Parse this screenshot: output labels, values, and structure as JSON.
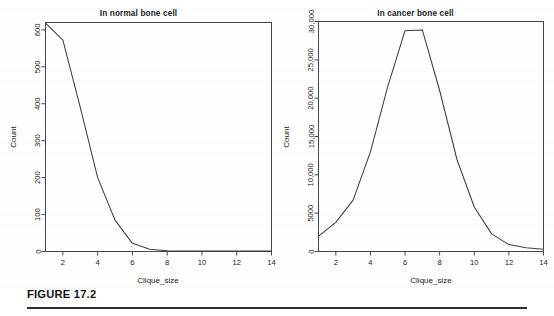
{
  "figure": {
    "caption": "FIGURE 17.2",
    "panel_count": 2
  },
  "panels": [
    {
      "key": "normal",
      "title": "In normal bone cell",
      "xlabel": "Clique_size",
      "ylabel": "Count"
    },
    {
      "key": "cancer",
      "title": "In cancer bone cell",
      "xlabel": "Clique_size",
      "ylabel": "Count"
    }
  ],
  "chart_data": [
    {
      "type": "line",
      "title": "In normal bone cell",
      "xlabel": "Clique_size",
      "ylabel": "Count",
      "xlim": [
        1,
        14
      ],
      "ylim": [
        0,
        620
      ],
      "grid": false,
      "legend": "none",
      "xticks": [
        2,
        4,
        6,
        8,
        10,
        12,
        14
      ],
      "xtick_labels": [
        "2",
        "4",
        "6",
        "8",
        "10",
        "12",
        "14"
      ],
      "yticks": [
        0,
        100,
        200,
        300,
        400,
        500,
        600
      ],
      "ytick_labels": [
        "0",
        "100",
        "200",
        "300",
        "400",
        "500",
        "600"
      ],
      "x": [
        1,
        2,
        3,
        4,
        5,
        6,
        7,
        8,
        9,
        10,
        11,
        12,
        13,
        14
      ],
      "values": [
        618,
        572,
        390,
        200,
        85,
        22,
        6,
        2,
        1,
        1,
        1,
        1,
        1,
        1
      ]
    },
    {
      "type": "line",
      "title": "In cancer bone cell",
      "xlabel": "Clique_size",
      "ylabel": "Count",
      "xlim": [
        1,
        14
      ],
      "ylim": [
        0,
        30000
      ],
      "grid": false,
      "legend": "none",
      "xticks": [
        2,
        4,
        6,
        8,
        10,
        12,
        14
      ],
      "xtick_labels": [
        "2",
        "4",
        "6",
        "8",
        "10",
        "12",
        "14"
      ],
      "yticks": [
        0,
        5000,
        10000,
        15000,
        20000,
        25000,
        30000
      ],
      "ytick_labels": [
        "0",
        "5000",
        "10,000",
        "15,000",
        "20,000",
        "25,000",
        "30,000"
      ],
      "x": [
        1,
        2,
        3,
        4,
        5,
        6,
        7,
        8,
        9,
        10,
        11,
        12,
        13,
        14
      ],
      "values": [
        2000,
        3800,
        6700,
        13000,
        21500,
        28800,
        28900,
        21000,
        12000,
        5800,
        2300,
        900,
        500,
        300
      ]
    }
  ]
}
